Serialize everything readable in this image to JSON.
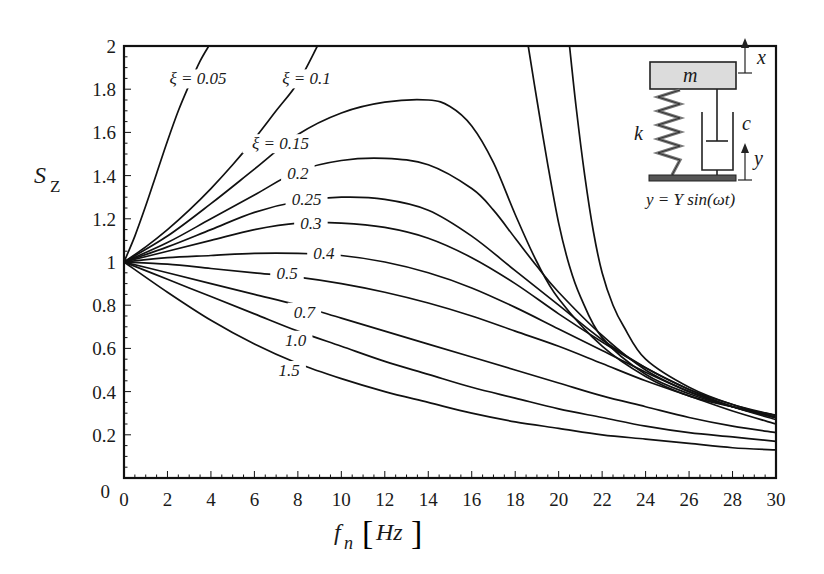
{
  "chart_data": {
    "type": "line",
    "title": "",
    "xlabel": "f_n [Hz]",
    "ylabel": "S_Z",
    "xlim": [
      0,
      30
    ],
    "ylim": [
      0,
      2
    ],
    "grid": false,
    "legend_position": "inline curve labels",
    "x_ticks": [
      0,
      2,
      4,
      6,
      8,
      10,
      12,
      14,
      16,
      18,
      20,
      22,
      24,
      26,
      28,
      30
    ],
    "y_ticks": [
      0,
      0.2,
      0.4,
      0.6,
      0.8,
      1,
      1.2,
      1.4,
      1.6,
      1.8,
      2
    ],
    "x_tick_labels": [
      "0",
      "2",
      "4",
      "6",
      "8",
      "10",
      "12",
      "14",
      "16",
      "18",
      "20",
      "22",
      "24",
      "26",
      "28",
      "30"
    ],
    "y_tick_labels": [
      "0",
      "0.2",
      "0.4",
      "0.6",
      "0.8",
      "1",
      "1.2",
      "1.4",
      "1.6",
      "1.8",
      "2"
    ],
    "series": [
      {
        "name": "ξ = 0.05",
        "label": "ξ = 0.05",
        "label_pos": [
          3.4,
          1.85
        ],
        "x": [
          0,
          0.5,
          1.0,
          1.5,
          2.0,
          2.5,
          3.0,
          3.5,
          3.9
        ],
        "values": [
          1,
          1.12,
          1.26,
          1.41,
          1.56,
          1.7,
          1.82,
          1.93,
          2.0
        ]
      },
      {
        "name": "ξ = 0.1",
        "label": "ξ = 0.1",
        "label_pos": [
          8.4,
          1.85
        ],
        "x": [
          0,
          1,
          2,
          3,
          4,
          5,
          6,
          7,
          8,
          8.9
        ],
        "values": [
          1,
          1.07,
          1.15,
          1.24,
          1.34,
          1.45,
          1.57,
          1.7,
          1.83,
          2.0
        ]
      },
      {
        "name": "ξ = 0.15",
        "label": "ξ = 0.15",
        "label_pos": [
          7.2,
          1.55
        ],
        "x": [
          0,
          2,
          4,
          6,
          8,
          10,
          12,
          14,
          15,
          16,
          17,
          18,
          19,
          20,
          22,
          24,
          26,
          28,
          30
        ],
        "values": [
          1,
          1.12,
          1.27,
          1.43,
          1.59,
          1.69,
          1.74,
          1.75,
          1.72,
          1.63,
          1.46,
          1.22,
          1.0,
          0.83,
          0.61,
          0.47,
          0.38,
          0.33,
          0.29
        ]
      },
      {
        "name": "0.2",
        "label": "0.2",
        "label_pos": [
          8.0,
          1.41
        ],
        "x": [
          0,
          2,
          4,
          6,
          8,
          10,
          12,
          14,
          16,
          17,
          18,
          19,
          20,
          22,
          24,
          26,
          28,
          30
        ],
        "values": [
          1,
          1.09,
          1.2,
          1.31,
          1.42,
          1.47,
          1.48,
          1.45,
          1.34,
          1.24,
          1.11,
          0.98,
          0.86,
          0.66,
          0.5,
          0.4,
          0.33,
          0.28
        ]
      },
      {
        "name": "0.25",
        "label": "0.25",
        "label_pos": [
          8.4,
          1.29
        ],
        "x": [
          0,
          2,
          4,
          6,
          8,
          10,
          12,
          14,
          16,
          18,
          20,
          22,
          24,
          26,
          28,
          30
        ],
        "values": [
          1,
          1.07,
          1.15,
          1.23,
          1.28,
          1.3,
          1.29,
          1.24,
          1.12,
          0.96,
          0.8,
          0.64,
          0.51,
          0.41,
          0.33,
          0.28
        ]
      },
      {
        "name": "0.3",
        "label": "0.3",
        "label_pos": [
          8.6,
          1.18
        ],
        "x": [
          0,
          2,
          4,
          6,
          8,
          10,
          12,
          14,
          16,
          18,
          20,
          22,
          24,
          26,
          28,
          30
        ],
        "values": [
          1,
          1.05,
          1.1,
          1.15,
          1.18,
          1.18,
          1.16,
          1.11,
          1.02,
          0.9,
          0.76,
          0.63,
          0.51,
          0.41,
          0.34,
          0.28
        ]
      },
      {
        "name": "0.4",
        "label": "0.4",
        "label_pos": [
          9.2,
          1.04
        ],
        "x": [
          0,
          2,
          4,
          6,
          8,
          10,
          12,
          14,
          16,
          18,
          20,
          22,
          24,
          26,
          28,
          30
        ],
        "values": [
          1,
          1.02,
          1.03,
          1.04,
          1.04,
          1.03,
          1.0,
          0.95,
          0.88,
          0.79,
          0.69,
          0.59,
          0.49,
          0.4,
          0.33,
          0.27
        ]
      },
      {
        "name": "0.5",
        "label": "0.5",
        "label_pos": [
          7.5,
          0.95
        ],
        "x": [
          0,
          2,
          4,
          6,
          8,
          10,
          12,
          14,
          16,
          18,
          20,
          22,
          24,
          26,
          28,
          30
        ],
        "values": [
          1,
          0.99,
          0.97,
          0.95,
          0.93,
          0.9,
          0.86,
          0.81,
          0.75,
          0.68,
          0.61,
          0.53,
          0.45,
          0.38,
          0.31,
          0.25
        ]
      },
      {
        "name": "0.7",
        "label": "0.7",
        "label_pos": [
          8.3,
          0.77
        ],
        "x": [
          0,
          2,
          4,
          6,
          8,
          10,
          12,
          14,
          16,
          18,
          20,
          22,
          24,
          26,
          28,
          30
        ],
        "values": [
          1,
          0.95,
          0.9,
          0.85,
          0.8,
          0.74,
          0.68,
          0.62,
          0.56,
          0.5,
          0.44,
          0.38,
          0.33,
          0.28,
          0.24,
          0.21
        ]
      },
      {
        "name": "1.0",
        "label": "1.0",
        "label_pos": [
          7.9,
          0.64
        ],
        "x": [
          0,
          2,
          4,
          6,
          8,
          10,
          12,
          14,
          16,
          18,
          20,
          22,
          24,
          26,
          28,
          30
        ],
        "values": [
          1,
          0.92,
          0.84,
          0.76,
          0.68,
          0.61,
          0.54,
          0.48,
          0.42,
          0.37,
          0.32,
          0.28,
          0.24,
          0.21,
          0.19,
          0.17
        ]
      },
      {
        "name": "1.5",
        "label": "1.5",
        "label_pos": [
          7.6,
          0.5
        ],
        "x": [
          0,
          2,
          4,
          6,
          8,
          10,
          12,
          14,
          16,
          18,
          20,
          22,
          24,
          26,
          28,
          30
        ],
        "values": [
          1,
          0.86,
          0.73,
          0.62,
          0.53,
          0.46,
          0.4,
          0.35,
          0.3,
          0.26,
          0.23,
          0.2,
          0.18,
          0.16,
          0.14,
          0.13
        ]
      },
      {
        "name": "steep curve A",
        "label": "",
        "x": [
          18.6,
          19.0,
          19.5,
          20.0,
          20.5,
          21.0,
          22,
          24,
          26,
          28,
          30
        ],
        "values": [
          2.0,
          1.75,
          1.45,
          1.18,
          0.98,
          0.84,
          0.65,
          0.48,
          0.39,
          0.33,
          0.29
        ]
      },
      {
        "name": "steep curve B",
        "label": "",
        "x": [
          20.5,
          20.8,
          21.2,
          21.6,
          22.0,
          22.5,
          23,
          24,
          26,
          28,
          30
        ],
        "values": [
          2.0,
          1.72,
          1.4,
          1.14,
          0.95,
          0.8,
          0.7,
          0.55,
          0.42,
          0.34,
          0.29
        ]
      }
    ]
  },
  "axes": {
    "x_title_main": "f",
    "x_title_sub": "n",
    "x_title_unit": "Hz",
    "y_title_main": "S",
    "y_title_sub": "Z"
  },
  "inset": {
    "mass_label": "m",
    "spring_label": "k",
    "damper_label": "c",
    "top_disp_label": "x",
    "base_disp_label": "y",
    "equation": "y = Y sin(ωt)"
  }
}
